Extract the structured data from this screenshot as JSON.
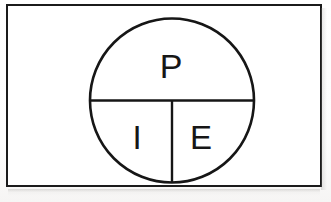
{
  "figure": {
    "title": "PIE circle diagram",
    "ink_color": "#161616",
    "frame_color": "#1b1b1b",
    "background_color": "#ffffff",
    "sections": [
      {
        "id": "top",
        "label": "P",
        "position": "upper half"
      },
      {
        "id": "bottom-left",
        "label": "I",
        "position": "lower left quadrant"
      },
      {
        "id": "bottom-right",
        "label": "E",
        "position": "lower right quadrant"
      }
    ],
    "circle": {
      "center_x": 86,
      "center_y": 86.5,
      "radius": 82
    },
    "dividers": {
      "horizontal_label": "diameter",
      "vertical_label": "lower radius"
    },
    "letters": {
      "p": "P",
      "i": "I",
      "e": "E"
    }
  }
}
